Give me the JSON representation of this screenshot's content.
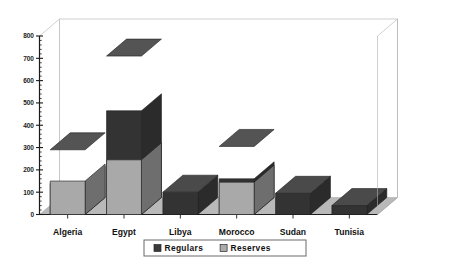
{
  "chart_data": {
    "type": "bar",
    "subtype": "stacked-3d-column",
    "title": "",
    "subtitle": "",
    "xlabel": "",
    "ylabel": "",
    "categories": [
      "Algeria",
      "Egypt",
      "Libya",
      "Morocco",
      "Sudan",
      "Tunisia"
    ],
    "series": [
      {
        "name": "Regulars",
        "color": "#333333",
        "values": [
          140,
          465,
          100,
          160,
          95,
          40
        ]
      },
      {
        "name": "Reserves",
        "color": "#a9a9a9",
        "values": [
          150,
          245,
          0,
          145,
          0,
          0
        ]
      }
    ],
    "totals": [
      290,
      710,
      100,
      305,
      95,
      40
    ],
    "ylim": [
      0,
      800
    ],
    "yticks": [
      0,
      100,
      200,
      300,
      400,
      500,
      600,
      700,
      800
    ],
    "ytick_labels": [
      "0",
      "100",
      "200",
      "300",
      "400",
      "500",
      "600",
      "700",
      "800"
    ],
    "minor_ticks_per_interval": 5,
    "grid": false,
    "legend": {
      "position": "bottom",
      "entries": [
        "Regulars",
        "Reserves"
      ]
    },
    "annotations": []
  },
  "axis": {
    "y_labels": [
      "800",
      "700",
      "600",
      "500",
      "400",
      "300",
      "200",
      "100",
      "0"
    ]
  },
  "legend": {
    "items": [
      {
        "label": "Regulars",
        "swatch": "#3a3a3a"
      },
      {
        "label": "Reserves",
        "swatch": "#ababab"
      }
    ]
  },
  "colors": {
    "regulars_front": "#333333",
    "regulars_side": "#2b2b2b",
    "regulars_top": "#4a4a4a",
    "reserves_front": "#a9a9a9",
    "reserves_side": "#6e6e6e",
    "reserves_top": "#545454",
    "floor": "#b9b9b9",
    "floor_edge": "#8f8f8f",
    "wall": "#ffffff",
    "wall_edge": "#b0b0b0",
    "axis": "#1a1a1a",
    "legend_border": "#6a6a6a"
  }
}
